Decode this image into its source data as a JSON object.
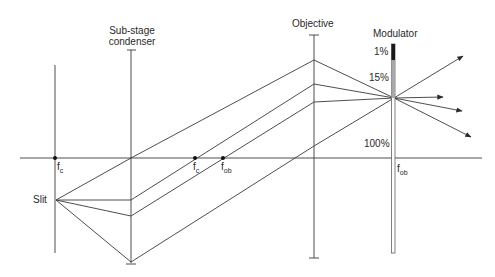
{
  "labels": {
    "condenser_line1": "Sub-stage",
    "condenser_line2": "condenser",
    "objective": "Objective",
    "modulator": "Modulator",
    "slit": "Slit",
    "pct_1": "1%",
    "pct_15": "15%",
    "pct_100": "100%",
    "f_main": "f",
    "sub_c": "c",
    "sub_ob": "ob"
  },
  "focal_points": [
    {
      "name": "fc-left",
      "label": "f",
      "sub": "c",
      "x": 55,
      "y": 158
    },
    {
      "name": "fc-right",
      "label": "f",
      "sub": "c",
      "x": 195,
      "y": 158
    },
    {
      "name": "fob-right",
      "label": "f",
      "sub": "ob",
      "x": 223,
      "y": 158
    },
    {
      "name": "fob-modulator",
      "label": "f",
      "sub": "ob",
      "x": 394,
      "y": 158
    }
  ],
  "modulator_zones": [
    {
      "label": "1%",
      "color": "#1a1a1a"
    },
    {
      "label": "15%",
      "color": "#a8a8a8"
    },
    {
      "label": "100%",
      "color": "#ffffff"
    }
  ],
  "colors": {
    "line": "#3a3a3a",
    "text": "#2a2a2a"
  }
}
